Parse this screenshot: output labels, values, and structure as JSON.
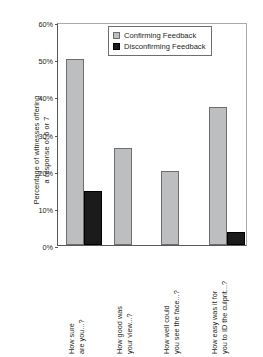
{
  "chart_data": {
    "type": "bar",
    "title": "",
    "xlabel": "",
    "ylabel_line1": "Percentage of witnesses offering",
    "ylabel_line2": "a response of 6 or 7",
    "ylim": [
      0,
      60
    ],
    "ytick_labels": [
      "60%",
      "50%",
      "40%",
      "30%",
      "20%",
      "10%",
      "0%"
    ],
    "ytick_values": [
      60,
      50,
      40,
      30,
      20,
      10,
      0
    ],
    "grid": false,
    "legend_position": "upper center inside",
    "categories": [
      "How sure are you...?",
      "How good was your view...?",
      "How well could you see the face...?",
      "How easy was it for you to ID the culprit...?"
    ],
    "category_lines": [
      {
        "line1": "How sure",
        "line2": "are you...?"
      },
      {
        "line1": "How good was",
        "line2": "your view...?"
      },
      {
        "line1": "How well could",
        "line2": "you see the face...?"
      },
      {
        "line1": "How easy was it for",
        "line2": "you to ID the culprit...?"
      }
    ],
    "series": [
      {
        "name": "Confirming Feedback",
        "color": "#bcbec0",
        "values": [
          50.0,
          26.0,
          20.0,
          37.0
        ]
      },
      {
        "name": "Disconfirming Feedback",
        "color": "#1b1b1b",
        "values": [
          14.5,
          0,
          0,
          3.5
        ]
      }
    ]
  },
  "legend": {
    "entries": [
      {
        "label": "Confirming Feedback",
        "swatch": "confirming"
      },
      {
        "label": "Disconfirming Feedback",
        "swatch": "disconfirming"
      }
    ]
  }
}
